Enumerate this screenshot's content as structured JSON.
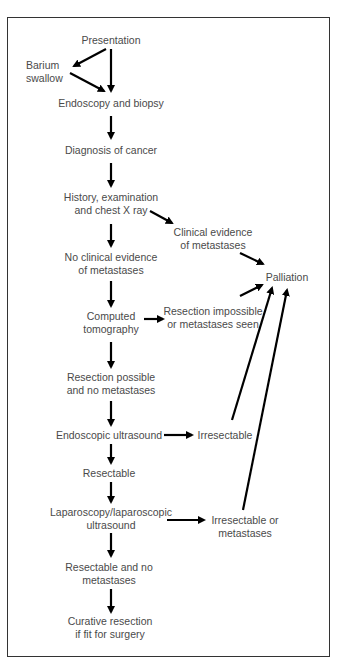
{
  "diagram": {
    "type": "flowchart",
    "nodes": {
      "presentation": {
        "line1": "Presentation"
      },
      "barium": {
        "line1": "Barium",
        "line2": "swallow"
      },
      "endoscopy": {
        "line1": "Endoscopy and biopsy"
      },
      "diagnosis": {
        "line1": "Diagnosis of cancer"
      },
      "history": {
        "line1": "History, examination",
        "line2": "and chest X ray"
      },
      "clinical_mets": {
        "line1": "Clinical evidence",
        "line2": "of metastases"
      },
      "no_clinical": {
        "line1": "No clinical evidence",
        "line2": "of metastases"
      },
      "palliation": {
        "line1": "Palliation"
      },
      "ct": {
        "line1": "Computed",
        "line2": "tomography"
      },
      "resection_impossible": {
        "line1": "Resection impossible",
        "line2": "or metastases seen"
      },
      "resection_possible": {
        "line1": "Resection possible",
        "line2": "and no metastases"
      },
      "eus": {
        "line1": "Endoscopic ultrasound"
      },
      "irresectable": {
        "line1": "Irresectable"
      },
      "resectable": {
        "line1": "Resectable"
      },
      "laparoscopy": {
        "line1": "Laparoscopy/laparoscopic",
        "line2": "ultrasound"
      },
      "irresectable_mets": {
        "line1": "Irresectable or",
        "line2": "metastases"
      },
      "resectable_no_mets": {
        "line1": "Resectable and no",
        "line2": "metastases"
      },
      "curative": {
        "line1": "Curative resection",
        "line2": "if fit for surgery"
      }
    },
    "edges": [
      [
        "presentation",
        "barium"
      ],
      [
        "presentation",
        "endoscopy"
      ],
      [
        "barium",
        "endoscopy"
      ],
      [
        "endoscopy",
        "diagnosis"
      ],
      [
        "diagnosis",
        "history"
      ],
      [
        "history",
        "clinical_mets"
      ],
      [
        "history",
        "no_clinical"
      ],
      [
        "clinical_mets",
        "palliation"
      ],
      [
        "no_clinical",
        "ct"
      ],
      [
        "ct",
        "resection_impossible"
      ],
      [
        "resection_impossible",
        "palliation"
      ],
      [
        "ct",
        "resection_possible"
      ],
      [
        "resection_possible",
        "eus"
      ],
      [
        "eus",
        "irresectable"
      ],
      [
        "irresectable",
        "palliation"
      ],
      [
        "eus",
        "resectable"
      ],
      [
        "resectable",
        "laparoscopy"
      ],
      [
        "laparoscopy",
        "irresectable_mets"
      ],
      [
        "irresectable_mets",
        "palliation"
      ],
      [
        "laparoscopy",
        "resectable_no_mets"
      ],
      [
        "resectable_no_mets",
        "curative"
      ]
    ]
  }
}
